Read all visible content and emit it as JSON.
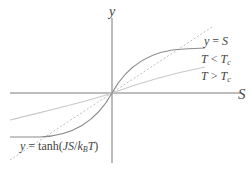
{
  "diagram": {
    "axes": {
      "x_label": "S",
      "y_label": "y"
    },
    "curves": [
      {
        "name": "identity-line",
        "label": "y = S",
        "style": "dashed",
        "color": "#b8b8b8"
      },
      {
        "name": "low-temperature-curve",
        "label": "T < T_c",
        "style": "solid",
        "color": "#8a8a8a"
      },
      {
        "name": "high-temperature-curve",
        "label": "T > T_c",
        "style": "solid",
        "color": "#c8c8c8"
      }
    ],
    "labels": {
      "identity": {
        "y": "y",
        "eq": " = ",
        "s": "S"
      },
      "low_t": {
        "t": "T",
        "op": " < ",
        "tc": "T",
        "sub": "c"
      },
      "high_t": {
        "t": "T",
        "op": " > ",
        "tc": "T",
        "sub": "c"
      },
      "formula": {
        "y": "y",
        "eq": " = tanh(",
        "js": "JS",
        "slash": "/",
        "k": "k",
        "sub": "B",
        "t": "T",
        "close": ")"
      }
    },
    "colors": {
      "axis": "#777777",
      "text": "#444444"
    }
  }
}
